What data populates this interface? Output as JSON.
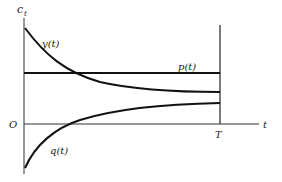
{
  "diagram": {
    "type": "function-plot",
    "axes": {
      "y_label": "c",
      "y_label_sub": "t",
      "x_label": "t",
      "origin_label": "O",
      "terminal_label": "T"
    },
    "curves": [
      {
        "name": "y",
        "label": "y(t)",
        "behavior": "decreasing, convex, starts high and approaches a level below p(t)"
      },
      {
        "name": "p",
        "label": "p(t)",
        "behavior": "constant horizontal line"
      },
      {
        "name": "q",
        "label": "q(t)",
        "behavior": "increasing, concave, starts negative, crosses zero, approaches a level below y(T)"
      }
    ],
    "colors": {
      "line": "#1a1a1a",
      "background": "#ffffff"
    }
  }
}
